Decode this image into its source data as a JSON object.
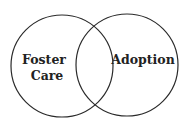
{
  "diagram": {
    "type": "venn",
    "sets": [
      {
        "label_line1": "Foster",
        "label_line2": "Care",
        "cx": 62,
        "cy": 66,
        "r": 51
      },
      {
        "label_line1": "Adoption",
        "cx": 127,
        "cy": 65,
        "r": 51
      }
    ],
    "stroke_color": "#2a2a2a",
    "background": "#ffffff"
  }
}
